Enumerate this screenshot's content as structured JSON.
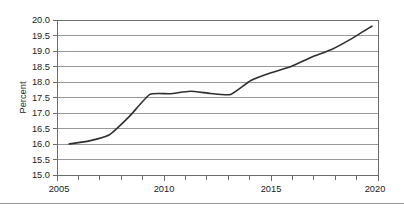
{
  "chart_data": {
    "type": "line",
    "title": "",
    "xlabel": "",
    "ylabel": "Percent",
    "xlim": [
      2004.4,
      2020.3
    ],
    "ylim": [
      15.0,
      20.0
    ],
    "grid": true,
    "legend": "none",
    "y_ticks": [
      "15.0",
      "15.5",
      "16.0",
      "16.5",
      "17.0",
      "17.5",
      "18.0",
      "18.5",
      "19.0",
      "19.5",
      "20.0"
    ],
    "y_tick_values": [
      15.0,
      15.5,
      16.0,
      16.5,
      17.0,
      17.5,
      18.0,
      18.5,
      19.0,
      19.5,
      20.0
    ],
    "x_ticks": [
      "2005",
      "2010",
      "2015",
      "2020"
    ],
    "x_tick_values": [
      2005,
      2010,
      2015,
      2020
    ],
    "x_minor_ticks": [
      2006,
      2007,
      2008,
      2009,
      2011,
      2012,
      2013,
      2014,
      2016,
      2017,
      2018,
      2019
    ],
    "series": [
      {
        "name": "Percent",
        "color": "#2f2f2f",
        "x": [
          2005,
          2006,
          2007,
          2008,
          2009,
          2010,
          2011,
          2012,
          2013,
          2014,
          2015,
          2016,
          2017,
          2018,
          2019,
          2020
        ],
        "values": [
          16.0,
          16.1,
          16.3,
          16.9,
          17.6,
          17.62,
          17.7,
          17.63,
          17.6,
          18.05,
          18.3,
          18.5,
          18.8,
          19.05,
          19.4,
          19.8
        ]
      }
    ]
  },
  "figure": {
    "y_axis_title": "Percent"
  }
}
